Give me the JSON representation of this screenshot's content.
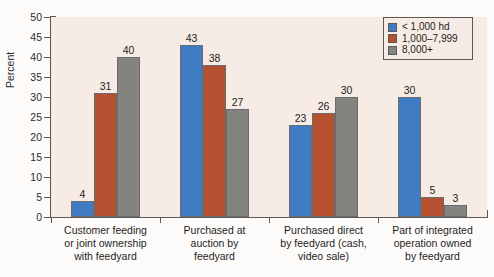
{
  "chart_data": {
    "type": "bar",
    "title": "",
    "subtitle": "",
    "xlabel": "",
    "ylabel": "Percent",
    "ylim": [
      0,
      50
    ],
    "yticks": [
      0,
      5,
      10,
      15,
      20,
      25,
      30,
      35,
      40,
      45,
      50
    ],
    "grid": false,
    "legend_position": "top-right",
    "categories": [
      "Customer feeding\nor joint ownership\nwith feedyard",
      "Purchased at\nauction by\nfeedyard",
      "Purchased direct\nby feedyard (cash,\nvideo sale)",
      "Part of integrated\noperation owned\nby feedyard"
    ],
    "series": [
      {
        "name": "< 1,000 hd",
        "color": "#3f7cc4",
        "values": [
          4,
          43,
          23,
          30
        ]
      },
      {
        "name": "1,000–7,999",
        "color": "#b55130",
        "values": [
          31,
          38,
          26,
          5
        ]
      },
      {
        "name": "8,000+",
        "color": "#83847f",
        "values": [
          40,
          27,
          30,
          3
        ]
      }
    ]
  },
  "axis": {
    "y_title": "Percent",
    "y_tick_labels": [
      "0",
      "5",
      "10",
      "15",
      "20",
      "25",
      "30",
      "35",
      "40",
      "45",
      "50"
    ]
  },
  "legend": {
    "entries": [
      {
        "label": "< 1,000 hd"
      },
      {
        "label": "1,000–7,999"
      },
      {
        "label": "8,000+"
      }
    ]
  },
  "colors": {
    "series_1": "#3f7cc4",
    "series_2": "#b55130",
    "series_3": "#83847f",
    "plot_background": "#f7ece5",
    "page_background": "#fdfbf9",
    "axis_line": "#5a5754",
    "text": "#1d1d1d"
  }
}
